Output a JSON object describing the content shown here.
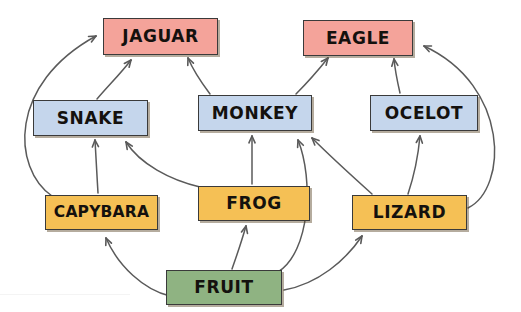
{
  "diagram": {
    "type": "food-web",
    "caption": "",
    "colors": {
      "producer": "#8FB382",
      "primary_consumer": "#F5C055",
      "secondary_consumer": "#C5D6EC",
      "apex_predator": "#F4A39A",
      "box_border": "#3a3a3a",
      "arrow": "#5a5a5a",
      "background": "#ffffff"
    },
    "nodes": [
      {
        "id": "jaguar",
        "label": "JAGUAR",
        "trophic": "apex_predator",
        "color": "#F4A39A",
        "x": 103,
        "y": 18,
        "w": 115,
        "h": 37
      },
      {
        "id": "eagle",
        "label": "EAGLE",
        "trophic": "apex_predator",
        "color": "#F4A39A",
        "x": 303,
        "y": 20,
        "w": 110,
        "h": 36
      },
      {
        "id": "snake",
        "label": "SNAKE",
        "trophic": "secondary_consumer",
        "color": "#C5D6EC",
        "x": 33,
        "y": 100,
        "w": 115,
        "h": 36
      },
      {
        "id": "monkey",
        "label": "MONKEY",
        "trophic": "secondary_consumer",
        "color": "#C5D6EC",
        "x": 198,
        "y": 95,
        "w": 114,
        "h": 36
      },
      {
        "id": "ocelot",
        "label": "OCELOT",
        "trophic": "secondary_consumer",
        "color": "#C5D6EC",
        "x": 370,
        "y": 95,
        "w": 108,
        "h": 36
      },
      {
        "id": "capybara",
        "label": "CAPYBARA",
        "trophic": "primary_consumer",
        "color": "#F5C055",
        "x": 45,
        "y": 195,
        "w": 113,
        "h": 35
      },
      {
        "id": "frog",
        "label": "FROG",
        "trophic": "primary_consumer",
        "color": "#F5C055",
        "x": 198,
        "y": 186,
        "w": 112,
        "h": 35
      },
      {
        "id": "lizard",
        "label": "LIZARD",
        "trophic": "primary_consumer",
        "color": "#F5C055",
        "x": 352,
        "y": 195,
        "w": 115,
        "h": 35
      },
      {
        "id": "fruit",
        "label": "FRUIT",
        "trophic": "producer",
        "color": "#8FB382",
        "x": 166,
        "y": 270,
        "w": 116,
        "h": 35
      }
    ],
    "links": [
      {
        "from": "capybara",
        "to": "jaguar",
        "path": "M 52 196 C 12 168 8 84 96 36",
        "arrow": [
          96,
          36,
          1.0,
          -0.54
        ]
      },
      {
        "from": "snake",
        "to": "jaguar",
        "path": "M 97 99 C 110 84 122 72 131 60",
        "arrow": [
          131,
          60,
          0.62,
          -0.78
        ]
      },
      {
        "from": "monkey",
        "to": "jaguar",
        "path": "M 210 94 C 201 82 193 70 188 58",
        "arrow": [
          188,
          58,
          -0.38,
          -0.92
        ]
      },
      {
        "from": "monkey",
        "to": "eagle",
        "path": "M 296 94 C 308 82 320 68 328 58",
        "arrow": [
          328,
          58,
          0.62,
          -0.78
        ]
      },
      {
        "from": "ocelot",
        "to": "eagle",
        "path": "M 400 93 C 397 80 395 70 394 59",
        "arrow": [
          394,
          59,
          -0.12,
          -0.99
        ]
      },
      {
        "from": "lizard",
        "to": "eagle",
        "path": "M 468 208 C 508 188 510 86 424 46",
        "arrow": [
          424,
          46,
          -0.92,
          -0.4
        ]
      },
      {
        "from": "lizard",
        "to": "ocelot",
        "path": "M 408 194 C 414 176 418 158 420 136",
        "arrow": [
          420,
          136,
          0.1,
          -0.99
        ]
      },
      {
        "from": "capybara",
        "to": "snake",
        "path": "M 98 193 C 97 176 96 160 95 140",
        "arrow": [
          95,
          140,
          -0.06,
          -0.99
        ]
      },
      {
        "from": "frog",
        "to": "snake",
        "path": "M 200 187 C 170 180 140 164 126 142",
        "arrow": [
          126,
          142,
          -0.55,
          -0.84
        ]
      },
      {
        "from": "frog",
        "to": "monkey",
        "path": "M 252 184 C 252 170 252 152 252 136",
        "arrow": [
          252,
          136,
          0,
          -1
        ]
      },
      {
        "from": "lizard",
        "to": "monkey",
        "path": "M 372 194 C 352 176 330 156 312 138",
        "arrow": [
          312,
          138,
          -0.72,
          -0.7
        ]
      },
      {
        "from": "fruit",
        "to": "monkey",
        "path": "M 278 272 C 310 252 314 180 298 140",
        "arrow": [
          298,
          140,
          -0.36,
          -0.93
        ]
      },
      {
        "from": "fruit",
        "to": "frog",
        "path": "M 232 269 C 238 252 242 240 246 226",
        "arrow": [
          246,
          226,
          0.22,
          -0.97
        ]
      },
      {
        "from": "fruit",
        "to": "capybara",
        "path": "M 170 296 C 144 290 118 266 106 238",
        "arrow": [
          106,
          238,
          -0.38,
          -0.92
        ]
      },
      {
        "from": "fruit",
        "to": "lizard",
        "path": "M 284 290 C 318 284 346 260 362 236",
        "arrow": [
          362,
          236,
          0.55,
          -0.84
        ]
      }
    ]
  }
}
